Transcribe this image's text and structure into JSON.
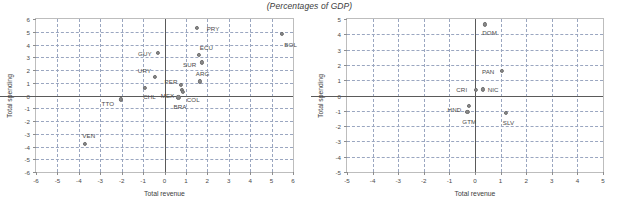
{
  "figure": {
    "title": "(Percentages of GDP)"
  },
  "chart_data": [
    {
      "id": "left",
      "type": "scatter",
      "title": "(Percentages of GDP)",
      "xlabel": "Total revenue",
      "ylabel": "Total spending",
      "xlim": [
        -6,
        6
      ],
      "ylim": [
        -6,
        6
      ],
      "xticks": [
        "-6",
        "-5",
        "-4",
        "-3",
        "-2",
        "-1",
        "0",
        "1",
        "2",
        "3",
        "4",
        "5",
        "6"
      ],
      "yticks": [
        "-6",
        "-5",
        "-4",
        "-3",
        "-2",
        "-1",
        "0",
        "1",
        "2",
        "3",
        "4",
        "5",
        "6"
      ],
      "grid": true,
      "legend": "none",
      "marker_color": "#8a8a8a",
      "points": [
        {
          "label": "PRY",
          "x": 1.5,
          "y": 5.3,
          "lx": 10,
          "ly": 1
        },
        {
          "label": "BOL",
          "x": 5.5,
          "y": 4.85,
          "lx": 2,
          "ly": 11
        },
        {
          "label": "GUY",
          "x": -0.3,
          "y": 3.35,
          "lx": -20,
          "ly": 1
        },
        {
          "label": "ECU",
          "x": 1.6,
          "y": 3.2,
          "lx": 1,
          "ly": -7
        },
        {
          "label": "SUR",
          "x": 1.75,
          "y": 2.6,
          "lx": -19,
          "ly": 3
        },
        {
          "label": "URY",
          "x": -0.45,
          "y": 1.45,
          "lx": -17,
          "ly": -6
        },
        {
          "label": "ARG",
          "x": 1.65,
          "y": 1.1,
          "lx": -4,
          "ly": -7
        },
        {
          "label": "PER",
          "x": 0.75,
          "y": 0.85,
          "lx": -16,
          "ly": -3
        },
        {
          "label": "CHL",
          "x": -0.9,
          "y": 0.6,
          "lx": -2,
          "ly": 9
        },
        {
          "label": "MEX",
          "x": 0.8,
          "y": 0.45,
          "lx": -21,
          "ly": 6
        },
        {
          "label": "COL",
          "x": 0.85,
          "y": 0.3,
          "lx": 4,
          "ly": 8
        },
        {
          "label": "BRA",
          "x": 0.65,
          "y": -0.15,
          "lx": -5,
          "ly": 10
        },
        {
          "label": "TTO",
          "x": -2.05,
          "y": -0.3,
          "lx": -19,
          "ly": 5
        },
        {
          "label": "VEN",
          "x": -3.7,
          "y": -3.8,
          "lx": -3,
          "ly": -8
        }
      ]
    },
    {
      "id": "right",
      "type": "scatter",
      "title": "(Percentages of GDP)",
      "xlabel": "Total revenue",
      "ylabel": "Total spending",
      "xlim": [
        -5,
        5
      ],
      "ylim": [
        -5,
        5
      ],
      "xticks": [
        "-5",
        "-4",
        "-3",
        "-2",
        "-1",
        "0",
        "1",
        "2",
        "3",
        "4",
        "5"
      ],
      "yticks": [
        "-5",
        "-4",
        "-3",
        "-2",
        "-1",
        "0",
        "1",
        "2",
        "3",
        "4",
        "5"
      ],
      "grid": true,
      "legend": "none",
      "marker_color": "#8a8a8a",
      "points": [
        {
          "label": "DOM",
          "x": 0.4,
          "y": 4.65,
          "lx": -3,
          "ly": 9
        },
        {
          "label": "PAN",
          "x": 1.05,
          "y": 1.6,
          "lx": -20,
          "ly": 1
        },
        {
          "label": "NIC",
          "x": 0.3,
          "y": 0.4,
          "lx": 5,
          "ly": 1
        },
        {
          "label": "CRI",
          "x": 0.05,
          "y": 0.35,
          "lx": -20,
          "ly": 0
        },
        {
          "label": "HND",
          "x": -0.25,
          "y": -0.7,
          "lx": -21,
          "ly": 4
        },
        {
          "label": "GTM",
          "x": -0.3,
          "y": -1.05,
          "lx": -5,
          "ly": 10
        },
        {
          "label": "SLV",
          "x": 1.2,
          "y": -1.15,
          "lx": -3,
          "ly": 10
        }
      ]
    }
  ]
}
